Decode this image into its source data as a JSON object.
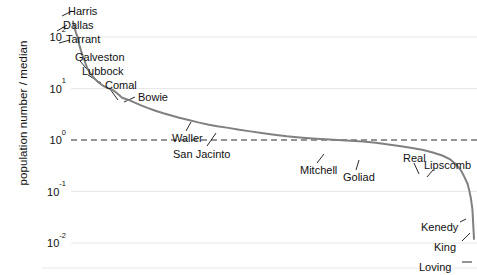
{
  "chart_data": {
    "type": "line",
    "title": "",
    "xlabel": "",
    "ylabel": "population number / median",
    "yscale": "log",
    "ylim": [
      0.005,
      400
    ],
    "xlim": [
      0,
      254
    ],
    "grid": true,
    "grid_axis": "y",
    "legend": "none",
    "yticks": [
      {
        "value": 100,
        "label": "10",
        "exponent": "2"
      },
      {
        "value": 10,
        "label": "10",
        "exponent": "1"
      },
      {
        "value": 1,
        "label": "10",
        "exponent": "0"
      },
      {
        "value": 0.1,
        "label": "10",
        "exponent": "-1"
      },
      {
        "value": 0.01,
        "label": "10",
        "exponent": "-2"
      }
    ],
    "reference_line": {
      "value": 1.0,
      "style": "dashed",
      "color": "#2b2b2b",
      "label": "median"
    },
    "series": [
      {
        "name": "Texas counties population / median",
        "color": "#808080",
        "marker": "dotted-line",
        "x": [
          1,
          2,
          3,
          4,
          5,
          6,
          7,
          8,
          9,
          10,
          12,
          14,
          16,
          18,
          20,
          23,
          26,
          29,
          32,
          36,
          40,
          44,
          48,
          53,
          58,
          63,
          68,
          74,
          80,
          86,
          92,
          99,
          106,
          113,
          120,
          128,
          136,
          144,
          152,
          160,
          168,
          176,
          184,
          192,
          200,
          208,
          215,
          222,
          228,
          234,
          239,
          243,
          246,
          248,
          250,
          251,
          252,
          253,
          254
        ],
        "y": [
          200,
          150,
          118,
          98,
          70,
          55,
          44,
          37,
          30,
          25,
          19.5,
          16.5,
          14.0,
          12.5,
          11.3,
          10.2,
          9.4,
          8.0,
          6.6,
          6.0,
          5.3,
          4.7,
          4.2,
          3.7,
          3.3,
          3.0,
          2.7,
          2.45,
          2.2,
          2.0,
          1.85,
          1.72,
          1.58,
          1.47,
          1.37,
          1.27,
          1.18,
          1.12,
          1.07,
          1.03,
          1.0,
          0.97,
          0.93,
          0.88,
          0.82,
          0.76,
          0.7,
          0.64,
          0.57,
          0.5,
          0.42,
          0.33,
          0.25,
          0.19,
          0.14,
          0.105,
          0.075,
          0.045,
          0.012
        ]
      }
    ],
    "annotations": [
      {
        "label": "Harris",
        "text_x": 68,
        "text_y": 6,
        "point_x": 73,
        "point_y": 16,
        "leader_x1": 62,
        "leader_y1": 16,
        "leader_x2": 72,
        "leader_y2": 11
      },
      {
        "label": "Dallas",
        "text_x": 63,
        "text_y": 20,
        "point_x": 76,
        "point_y": 31,
        "leader_x1": 57,
        "leader_y1": 31,
        "leader_x2": 67,
        "leader_y2": 25
      },
      {
        "label": "Tarrant",
        "text_x": 66,
        "text_y": 34,
        "point_x": 79,
        "point_y": 40,
        "leader_x1": 59,
        "leader_y1": 43,
        "leader_x2": 70,
        "leader_y2": 40
      },
      {
        "label": "Galveston",
        "text_x": 75,
        "text_y": 52,
        "point_x": 97,
        "point_y": 75,
        "leader_x1": 92,
        "leader_y1": 75,
        "leader_x2": 80,
        "leader_y2": 61
      },
      {
        "label": "Lubbock",
        "text_x": 82,
        "text_y": 66,
        "point_x": 104,
        "point_y": 83,
        "leader_x1": 101,
        "leader_y1": 83,
        "leader_x2": 88,
        "leader_y2": 75
      },
      {
        "label": "Comal",
        "text_x": 105,
        "text_y": 80,
        "point_x": 119,
        "point_y": 100,
        "leader_x1": 118,
        "leader_y1": 100,
        "leader_x2": 110,
        "leader_y2": 89
      },
      {
        "label": "Bowie",
        "text_x": 138,
        "text_y": 92,
        "point_x": 125,
        "point_y": 103,
        "leader_x1": 135,
        "leader_y1": 97,
        "leader_x2": 124,
        "leader_y2": 102
      },
      {
        "label": "Waller",
        "text_x": 172,
        "text_y": 133,
        "point_x": 190,
        "point_y": 120,
        "leader_x1": 186,
        "leader_y1": 131,
        "leader_x2": 191,
        "leader_y2": 122
      },
      {
        "label": "San Jacinto",
        "text_x": 173,
        "text_y": 149,
        "point_x": 216,
        "point_y": 131,
        "leader_x1": 207,
        "leader_y1": 146,
        "leader_x2": 216,
        "leader_y2": 133
      },
      {
        "label": "Mitchell",
        "text_x": 300,
        "text_y": 165,
        "point_x": 322,
        "point_y": 152,
        "leader_x1": 317,
        "leader_y1": 163,
        "leader_x2": 324,
        "leader_y2": 154
      },
      {
        "label": "Goliad",
        "text_x": 343,
        "text_y": 172,
        "point_x": 357,
        "point_y": 158,
        "leader_x1": 356,
        "leader_y1": 170,
        "leader_x2": 359,
        "leader_y2": 160
      },
      {
        "label": "Real",
        "text_x": 403,
        "text_y": 153,
        "point_x": 418,
        "point_y": 175,
        "leader_x1": 414,
        "leader_y1": 163,
        "leader_x2": 419,
        "leader_y2": 174
      },
      {
        "label": "Lipscomb",
        "text_x": 424,
        "text_y": 160,
        "point_x": 425,
        "point_y": 177,
        "leader_x1": 433,
        "leader_y1": 170,
        "leader_x2": 427,
        "leader_y2": 177
      },
      {
        "label": "Kenedy",
        "text_x": 421,
        "text_y": 222,
        "point_x": 467,
        "point_y": 222,
        "leader_x1": 460,
        "leader_y1": 222,
        "leader_x2": 466,
        "leader_y2": 219
      },
      {
        "label": "King",
        "text_x": 434,
        "text_y": 242,
        "point_x": 471,
        "point_y": 233,
        "leader_x1": 462,
        "leader_y1": 241,
        "leader_x2": 470,
        "leader_y2": 233
      },
      {
        "label": "Loving",
        "text_x": 419,
        "text_y": 262,
        "point_x": 474,
        "point_y": 262,
        "leader_x1": 462,
        "leader_y1": 262,
        "leader_x2": 472,
        "leader_y2": 262
      }
    ]
  },
  "colors": {
    "curve": "#808080",
    "median_line": "#2b2b2b",
    "grid": "#e8e8e8",
    "text": "#111111",
    "background": "#ffffff"
  }
}
